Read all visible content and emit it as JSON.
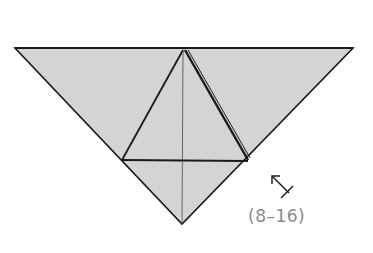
{
  "diagram": {
    "paper_color": "#d4d4d4",
    "line_color": "#1a1a1a",
    "step_label": "(8–16)",
    "symbol": "arrow-to-x (turn over / fold behind indicator)"
  }
}
